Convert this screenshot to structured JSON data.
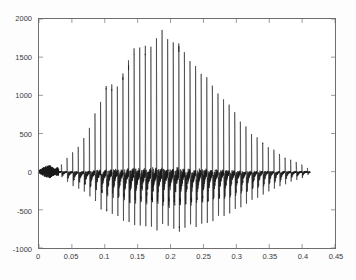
{
  "chart_data": {
    "type": "line",
    "title": "",
    "xlabel": "",
    "ylabel": "",
    "xlim": [
      0,
      0.45
    ],
    "ylim": [
      -1000,
      2000
    ],
    "xticks": [
      0,
      0.05,
      0.1,
      0.15,
      0.2,
      0.25,
      0.3,
      0.35,
      0.4,
      0.45
    ],
    "xtick_labels": [
      "0",
      "0.05",
      "0.1",
      "0.15",
      "0.2",
      "0.25",
      "0.3",
      "0.35",
      "0.4",
      "0.45"
    ],
    "yticks": [
      -1000,
      -500,
      0,
      500,
      1000,
      1500,
      2000
    ],
    "ytick_labels": [
      "-1000",
      "-500",
      "0",
      "500",
      "1000",
      "1500",
      "2000"
    ],
    "grid": false,
    "legend": null,
    "line_color": "#1a1a1a",
    "axis_color": "#6e6e6e",
    "background_color": "#ffffff",
    "signal": {
      "name": "amplitude",
      "t_start": 0.0,
      "t_end": 0.412,
      "sample_rate_hz": 8000,
      "pitch_period_s": 0.0085,
      "pulse_count": 48,
      "peak_positive": 1780,
      "peak_positive_time": 0.19,
      "peak_negative": -920,
      "peak_negative_time": 0.215,
      "envelope_breakpoints": [
        {
          "t": 0.0,
          "pos": 20,
          "neg": -18
        },
        {
          "t": 0.008,
          "pos": 70,
          "neg": -65
        },
        {
          "t": 0.016,
          "pos": 95,
          "neg": -85
        },
        {
          "t": 0.024,
          "pos": 45,
          "neg": -40
        },
        {
          "t": 0.034,
          "pos": 90,
          "neg": -80
        },
        {
          "t": 0.045,
          "pos": 210,
          "neg": -190
        },
        {
          "t": 0.056,
          "pos": 300,
          "neg": -260
        },
        {
          "t": 0.068,
          "pos": 430,
          "neg": -330
        },
        {
          "t": 0.08,
          "pos": 620,
          "neg": -420
        },
        {
          "t": 0.092,
          "pos": 900,
          "neg": -560
        },
        {
          "t": 0.104,
          "pos": 1180,
          "neg": -640
        },
        {
          "t": 0.116,
          "pos": 1100,
          "neg": -700
        },
        {
          "t": 0.128,
          "pos": 1300,
          "neg": -760
        },
        {
          "t": 0.14,
          "pos": 1530,
          "neg": -800
        },
        {
          "t": 0.152,
          "pos": 1600,
          "neg": -820
        },
        {
          "t": 0.164,
          "pos": 1620,
          "neg": -860
        },
        {
          "t": 0.176,
          "pos": 1750,
          "neg": -870
        },
        {
          "t": 0.188,
          "pos": 1780,
          "neg": -880
        },
        {
          "t": 0.2,
          "pos": 1700,
          "neg": -900
        },
        {
          "t": 0.212,
          "pos": 1690,
          "neg": -920
        },
        {
          "t": 0.224,
          "pos": 1500,
          "neg": -880
        },
        {
          "t": 0.236,
          "pos": 1340,
          "neg": -860
        },
        {
          "t": 0.248,
          "pos": 1260,
          "neg": -840
        },
        {
          "t": 0.26,
          "pos": 1180,
          "neg": -800
        },
        {
          "t": 0.272,
          "pos": 1000,
          "neg": -760
        },
        {
          "t": 0.284,
          "pos": 900,
          "neg": -700
        },
        {
          "t": 0.296,
          "pos": 780,
          "neg": -640
        },
        {
          "t": 0.308,
          "pos": 640,
          "neg": -580
        },
        {
          "t": 0.32,
          "pos": 520,
          "neg": -500
        },
        {
          "t": 0.332,
          "pos": 430,
          "neg": -430
        },
        {
          "t": 0.344,
          "pos": 360,
          "neg": -360
        },
        {
          "t": 0.356,
          "pos": 290,
          "neg": -300
        },
        {
          "t": 0.368,
          "pos": 220,
          "neg": -240
        },
        {
          "t": 0.38,
          "pos": 160,
          "neg": -175
        },
        {
          "t": 0.392,
          "pos": 120,
          "neg": -130
        },
        {
          "t": 0.402,
          "pos": 85,
          "neg": -90
        },
        {
          "t": 0.412,
          "pos": 30,
          "neg": -30
        }
      ]
    }
  }
}
